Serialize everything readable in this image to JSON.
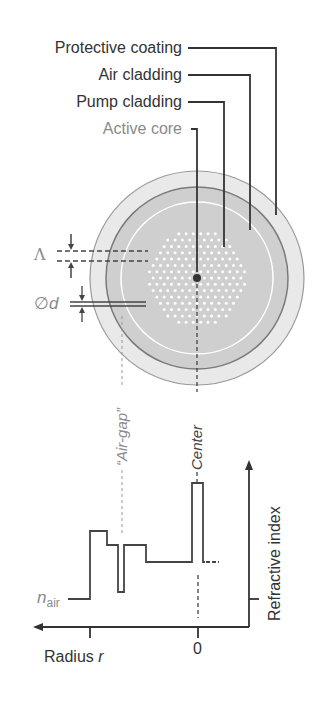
{
  "labels": {
    "protective_coating": "Protective coating",
    "air_cladding": "Air cladding",
    "pump_cladding": "Pump cladding",
    "active_core": "Active core",
    "lambda": "Λ",
    "diameter_symbol": "∅",
    "diameter_var": "d",
    "air_gap": "“Air-gap”",
    "center": "Center",
    "n_air_base": "n",
    "n_air_sub": "air",
    "radius": "Radius ",
    "radius_var": "r",
    "zero": "0",
    "refractive_index": "Refractive index"
  },
  "colors": {
    "line": "#333333",
    "text_gray": "#8a8a8a",
    "coating_fill": "#e8e8e8",
    "cladding_fill": "#cfcfcf",
    "ring_dark": "#777777",
    "hole_white": "#ffffff"
  },
  "fiber": {
    "center": [
      197,
      278
    ],
    "outer_radius": 107,
    "air_cladding_radius": 91,
    "pump_cladding_radius": 76,
    "hole_pitch": 7.3,
    "hole_radius": 1.5,
    "core_dot_radius": 4
  },
  "chart_data": {
    "type": "line",
    "title": "",
    "xlabel": "Radius r",
    "ylabel": "Refractive index",
    "x_ticks": [
      "0"
    ],
    "annotations": [
      "n_air",
      "“Air-gap”",
      "Center"
    ],
    "profile_steps_px": [
      [
        68,
        599
      ],
      [
        90,
        599
      ],
      [
        90,
        531
      ],
      [
        107,
        531
      ],
      [
        107,
        545
      ],
      [
        118,
        545
      ],
      [
        118,
        592
      ],
      [
        124,
        592
      ],
      [
        124,
        545
      ],
      [
        146,
        545
      ],
      [
        146,
        562
      ],
      [
        192,
        562
      ],
      [
        192,
        483
      ],
      [
        203,
        483
      ],
      [
        203,
        562
      ]
    ]
  }
}
